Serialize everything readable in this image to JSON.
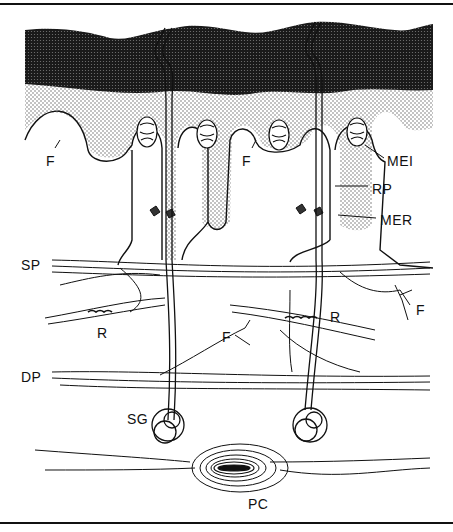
{
  "diagram": {
    "type": "anatomical line drawing",
    "labels": [
      {
        "id": "F1",
        "text": "F",
        "x": 46,
        "y": 154
      },
      {
        "id": "F2",
        "text": "F",
        "x": 242,
        "y": 154
      },
      {
        "id": "MEI",
        "text": "MEI",
        "x": 387,
        "y": 154
      },
      {
        "id": "RP",
        "text": "RP",
        "x": 372,
        "y": 182
      },
      {
        "id": "MER",
        "text": "MER",
        "x": 380,
        "y": 213
      },
      {
        "id": "SP",
        "text": "SP",
        "x": 21,
        "y": 258
      },
      {
        "id": "R1",
        "text": "R",
        "x": 97,
        "y": 326
      },
      {
        "id": "R2",
        "text": "R",
        "x": 330,
        "y": 310
      },
      {
        "id": "F3",
        "text": "F",
        "x": 416,
        "y": 303
      },
      {
        "id": "F4",
        "text": "F",
        "x": 222,
        "y": 330
      },
      {
        "id": "DP",
        "text": "DP",
        "x": 21,
        "y": 370
      },
      {
        "id": "SG",
        "text": "SG",
        "x": 127,
        "y": 412
      },
      {
        "id": "PC",
        "text": "PC",
        "x": 248,
        "y": 497
      }
    ],
    "colors": {
      "ink": "#111111",
      "background": "#ffffff",
      "stipple_dark": "#1a1a1a",
      "stipple_light": "#bdbdbd"
    }
  }
}
